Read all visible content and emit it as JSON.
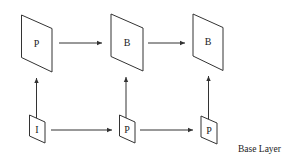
{
  "diagram": {
    "type": "frame-dependency",
    "colors": {
      "stroke": "#333333",
      "text": "#222222",
      "background": "#ffffff"
    },
    "enhancement_layer": {
      "frames": [
        {
          "id": "e1",
          "label": "P"
        },
        {
          "id": "e2",
          "label": "B"
        },
        {
          "id": "e3",
          "label": "B"
        }
      ]
    },
    "base_layer": {
      "label": "Base Layer",
      "frames": [
        {
          "id": "b1",
          "label": "I"
        },
        {
          "id": "b2",
          "label": "P"
        },
        {
          "id": "b3",
          "label": "P"
        }
      ]
    },
    "edges": [
      {
        "from": "e1",
        "to": "e2"
      },
      {
        "from": "e2",
        "to": "e3"
      },
      {
        "from": "b1",
        "to": "b2"
      },
      {
        "from": "b2",
        "to": "b3"
      },
      {
        "from": "b1",
        "to": "e1"
      },
      {
        "from": "b2",
        "to": "e2"
      },
      {
        "from": "b3",
        "to": "e3"
      }
    ]
  }
}
